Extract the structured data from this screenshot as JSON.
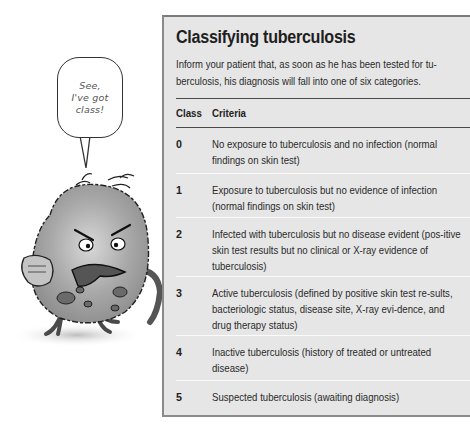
{
  "illustration": {
    "speech_bubble": "See,\nI've got\nclass!",
    "character": "angry-tuberculosis-germ-cartoon"
  },
  "panel": {
    "title": "Classifying tuberculosis",
    "intro": "Inform your patient that, as soon as he has been tested for tu-berculosis, his diagnosis will fall into one of six categories.",
    "colors": {
      "background": "#e6e6e6",
      "border": "#7a7a7a",
      "header_rule": "#4a4a4a",
      "row_divider": "#fbfbfb"
    },
    "table": {
      "headers": {
        "class": "Class",
        "criteria": "Criteria"
      },
      "rows": [
        {
          "class": "0",
          "criteria": "No exposure to tuberculosis and no infection (normal findings on skin test)"
        },
        {
          "class": "1",
          "criteria": "Exposure to tuberculosis but no evidence of infection (normal findings on skin test)"
        },
        {
          "class": "2",
          "criteria": "Infected with tuberculosis but no disease evident (pos-itive skin test results but no clinical or X-ray evidence of tuberculosis)"
        },
        {
          "class": "3",
          "criteria": "Active tuberculosis (defined by positive skin test re-sults, bacteriologic status, disease site, X-ray evi-dence, and drug therapy status)"
        },
        {
          "class": "4",
          "criteria": "Inactive tuberculosis (history of treated or untreated disease)"
        },
        {
          "class": "5",
          "criteria": "Suspected tuberculosis (awaiting diagnosis)"
        }
      ]
    }
  }
}
